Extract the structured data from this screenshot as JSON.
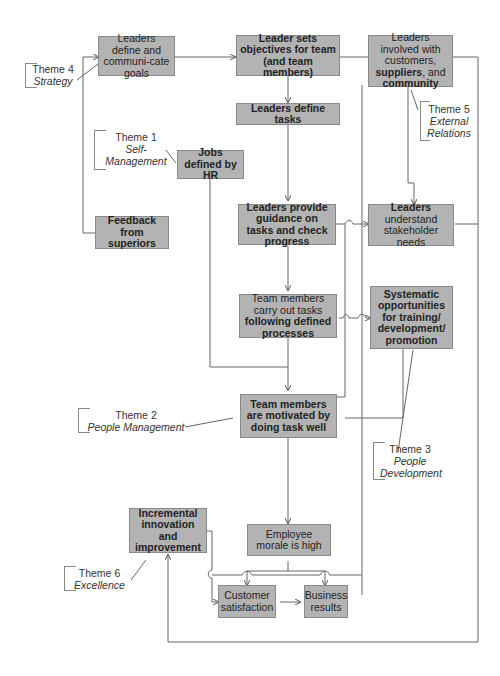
{
  "diagram": {
    "boxes": {
      "leaders_define_goals": {
        "text": "Leaders define and communi-cate goals"
      },
      "leader_sets_objectives": {
        "text": "Leader sets objectives for team (and team members)"
      },
      "leaders_involved": {
        "pre": "Leaders involved with customers, ",
        "b1": "suppliers",
        "mid": ", and ",
        "b2": "community"
      },
      "leaders_define_tasks": {
        "text": "Leaders define tasks"
      },
      "jobs_defined_hr": {
        "text": "Jobs defined by HR"
      },
      "feedback_superiors": {
        "text": "Feedback from superiors"
      },
      "leaders_guidance": {
        "text": "Leaders provide guidance on tasks and check progress"
      },
      "leaders_understand": {
        "b": "Leaders",
        "rest": "understand stakeholder needs"
      },
      "team_carry_out": {
        "pre": "Team members carry out tasks ",
        "b": "following defined processes"
      },
      "systematic_opportunities": {
        "text": "Systematic opportunities for training/ development/ promotion"
      },
      "team_motivated": {
        "text": "Team members are motivated by doing task well"
      },
      "incremental_innovation": {
        "text": "Incremental innovation and improvement"
      },
      "employee_morale": {
        "text": "Employee morale is high"
      },
      "customer_satisfaction": {
        "text": "Customer satisfaction"
      },
      "business_results": {
        "text": "Business results"
      }
    },
    "themes": [
      {
        "id": "theme4",
        "label": "Theme 4",
        "name": "Strategy"
      },
      {
        "id": "theme1",
        "label": "Theme 1",
        "name": "Self-Management"
      },
      {
        "id": "theme5",
        "label": "Theme 5",
        "name": "External Relations"
      },
      {
        "id": "theme2",
        "label": "Theme 2",
        "name": "People Management"
      },
      {
        "id": "theme3",
        "label": "Theme 3",
        "name": "People Development"
      },
      {
        "id": "theme6",
        "label": "Theme 6",
        "name": "Excellence"
      }
    ],
    "colors": {
      "box_fill": "#b3b3b3",
      "box_border": "#8a8a8a",
      "line": "#555555"
    }
  }
}
